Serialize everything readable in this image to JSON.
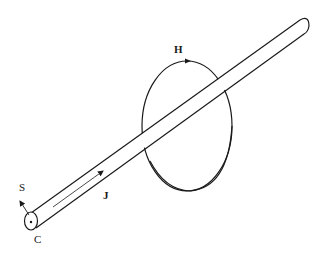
{
  "diagram": {
    "labels": {
      "h": "H",
      "j": "J",
      "s": "S",
      "c": "C"
    },
    "colors": {
      "stroke": "#1a1a1a",
      "background": "#ffffff"
    }
  }
}
